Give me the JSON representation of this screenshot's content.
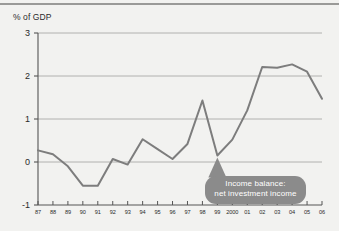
{
  "figure": {
    "name": "income-balance-chart",
    "background_color": "#f2f2f0",
    "top_rule_color": "#9a9a98"
  },
  "annotation": {
    "line1": "Income balance:",
    "line2": "net investment income",
    "bubble_color": "#8b8b8b",
    "text_color": "#ffffff",
    "pointer_target_year": "99"
  },
  "chart_data": {
    "type": "line",
    "title": "",
    "subtitle": "",
    "xlabel": "",
    "ylabel": "% of GDP",
    "ylim": [
      -1,
      3
    ],
    "yticks": [
      3,
      2,
      1,
      0,
      -1
    ],
    "ytick_labels": [
      "3",
      "2",
      "1",
      "0",
      "-1"
    ],
    "grid": true,
    "gridlines_at": [
      3,
      2,
      1,
      0
    ],
    "grid_color": "#a9a9a7",
    "legend": "none",
    "line_color": "#7d7d7d",
    "line_width": 2,
    "categories": [
      "87",
      "88",
      "89",
      "90",
      "91",
      "92",
      "93",
      "94",
      "95",
      "96",
      "97",
      "98",
      "99",
      "2000",
      "01",
      "02",
      "03",
      "04",
      "05",
      "06"
    ],
    "x": [
      1987,
      1988,
      1989,
      1990,
      1991,
      1992,
      1993,
      1994,
      1995,
      1996,
      1997,
      1998,
      1999,
      2000,
      2001,
      2002,
      2003,
      2004,
      2005,
      2006
    ],
    "series": [
      {
        "name": "Income balance: net investment income",
        "values": [
          0.27,
          0.18,
          -0.1,
          -0.55,
          -0.55,
          0.07,
          -0.06,
          0.53,
          0.3,
          0.07,
          0.42,
          1.43,
          0.15,
          0.52,
          1.2,
          2.21,
          2.19,
          2.27,
          2.1,
          1.47
        ]
      }
    ]
  }
}
